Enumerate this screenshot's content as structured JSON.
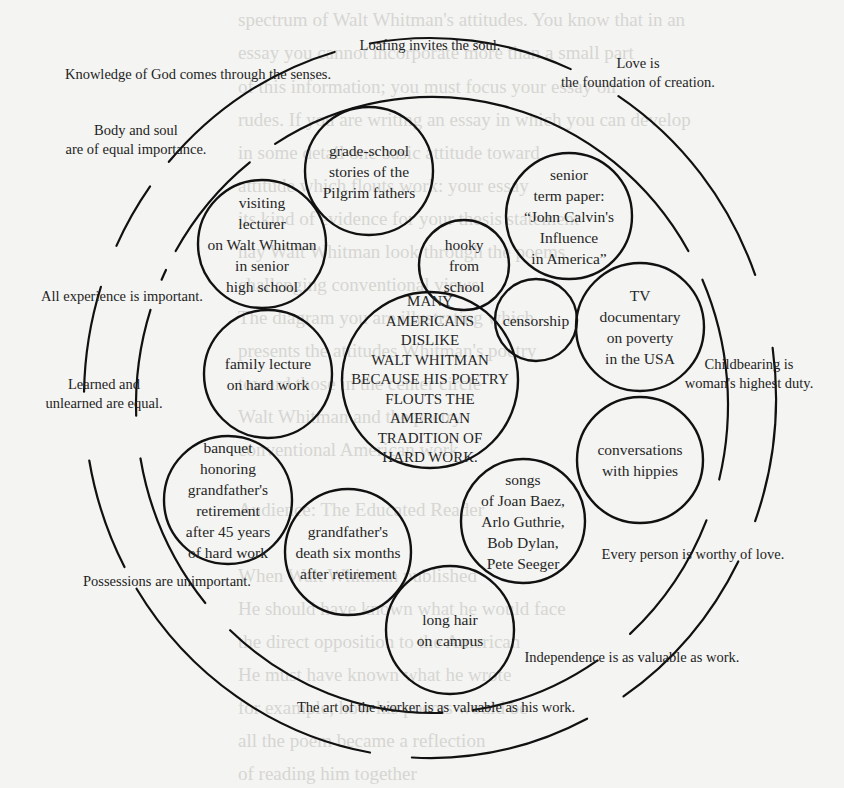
{
  "background_text": [
    {
      "text": "spectrum of Walt Whitman's attitudes. You know that in an",
      "x": 478,
      "y": 3
    },
    {
      "text": "essay you cannot incorporate more than a small part",
      "x": 478,
      "y": 36
    },
    {
      "text": "of this information; you must focus your essay on",
      "x": 478,
      "y": 70
    },
    {
      "text": "rudes. If you are writing an essay in which you can develop",
      "x": 478,
      "y": 103
    },
    {
      "text": "in some detail one basic attitude toward",
      "x": 478,
      "y": 136
    },
    {
      "text": "attitude which flouts work: your essay",
      "x": 478,
      "y": 169
    },
    {
      "text": "its kind of evidence for your thesis statement",
      "x": 478,
      "y": 202
    },
    {
      "text": "nay Walt Whitman look through the poems",
      "x": 478,
      "y": 235
    },
    {
      "text": "challenging conventional views",
      "x": 478,
      "y": 268
    },
    {
      "text": "The diagram you are illustrating which",
      "x": 478,
      "y": 301
    },
    {
      "text": "presents the attitudes Whitman's poetry",
      "x": 478,
      "y": 334
    },
    {
      "text": "toward those in the center circle",
      "x": 478,
      "y": 367
    },
    {
      "text": "Walt Whitman and the poetry",
      "x": 478,
      "y": 400
    },
    {
      "text": "conventional American work",
      "x": 478,
      "y": 433
    },
    {
      "text": "Audience: The Educated Reader",
      "x": 478,
      "y": 493
    },
    {
      "text": "When Walt Whitman published",
      "x": 478,
      "y": 559
    },
    {
      "text": "He should have known what he would face",
      "x": 478,
      "y": 592
    },
    {
      "text": "the direct opposition to the American",
      "x": 478,
      "y": 625
    },
    {
      "text": "He must have known what he wrote",
      "x": 478,
      "y": 658
    },
    {
      "text": "for example, how his poems would be",
      "x": 478,
      "y": 691
    },
    {
      "text": "all the poem became a reflection",
      "x": 478,
      "y": 724
    },
    {
      "text": "of reading him together",
      "x": 478,
      "y": 757
    }
  ],
  "diagram": {
    "stroke_color": "#111111",
    "outer_ring_labels": [
      {
        "id": "loafing",
        "lines": [
          "Loafing invites the soul."
        ],
        "x": 430,
        "y": 46
      },
      {
        "id": "love-creation",
        "lines": [
          "Love is",
          "the foundation of creation."
        ],
        "x": 638,
        "y": 64
      },
      {
        "id": "childbearing",
        "lines": [
          "Childbearing is",
          "woman's highest duty."
        ],
        "x": 749,
        "y": 365
      },
      {
        "id": "worthy-love",
        "lines": [
          "Every person is worthy of love."
        ],
        "x": 693,
        "y": 555
      },
      {
        "id": "art-worker",
        "lines": [
          "The art of the worker is as valuable as his work."
        ],
        "x": 436,
        "y": 708
      },
      {
        "id": "learned",
        "lines": [
          "Learned and",
          "unlearned are equal."
        ],
        "x": 104,
        "y": 385
      }
    ],
    "inner_ring_labels": [
      {
        "id": "knowledge-god",
        "lines": [
          "Knowledge of God comes through the senses."
        ],
        "x": 198,
        "y": 75
      },
      {
        "id": "body-soul",
        "lines": [
          "Body and soul",
          "are of equal importance."
        ],
        "x": 136,
        "y": 131
      },
      {
        "id": "all-experience",
        "lines": [
          "All experience is important."
        ],
        "x": 122,
        "y": 297
      },
      {
        "id": "possessions",
        "lines": [
          "Possessions are unimportant."
        ],
        "x": 167,
        "y": 582
      },
      {
        "id": "independence",
        "lines": [
          "Independence is as valuable as work."
        ],
        "x": 632,
        "y": 658
      }
    ],
    "core": {
      "id": "thesis",
      "lines": [
        "MANY",
        "AMERICANS",
        "DISLIKE",
        "WALT WHITMAN",
        "BECAUSE HIS POETRY",
        "FLOUTS THE",
        "AMERICAN",
        "TRADITION  OF",
        "HARD WORK."
      ],
      "cx": 430,
      "cy": 380,
      "r": 88
    },
    "experience_circles": [
      {
        "id": "grade-school",
        "lines": [
          "grade-school",
          "stories of the",
          "Pilgrim fathers"
        ],
        "cx": 369,
        "cy": 171,
        "r": 64
      },
      {
        "id": "visiting-lecturer",
        "lines": [
          "visiting",
          "lecturer",
          "on Walt Whitman",
          "in senior",
          "high school"
        ],
        "cx": 262,
        "cy": 244,
        "r": 64
      },
      {
        "id": "senior-term-paper",
        "lines": [
          "senior",
          "term paper:",
          "“John Calvin's",
          "Influence",
          "in America”"
        ],
        "cx": 569,
        "cy": 216,
        "r": 63
      },
      {
        "id": "hooky",
        "lines": [
          "hooky",
          "from",
          "school"
        ],
        "cx": 464,
        "cy": 265,
        "r": 45
      },
      {
        "id": "censorship",
        "lines": [
          "censorship"
        ],
        "cx": 536,
        "cy": 320,
        "r": 41
      },
      {
        "id": "tv-documentary",
        "lines": [
          "TV",
          "documentary",
          "on poverty",
          "in the USA"
        ],
        "cx": 640,
        "cy": 327,
        "r": 64
      },
      {
        "id": "family-lecture",
        "lines": [
          "family lecture",
          "on hard work"
        ],
        "cx": 268,
        "cy": 374,
        "r": 64
      },
      {
        "id": "conversations-hippies",
        "lines": [
          "conversations",
          "with hippies"
        ],
        "cx": 640,
        "cy": 460,
        "r": 63
      },
      {
        "id": "banquet",
        "lines": [
          "banquet",
          "honoring",
          "grandfather's",
          "retirement",
          "after 45 years",
          "of hard work"
        ],
        "cx": 228,
        "cy": 500,
        "r": 64
      },
      {
        "id": "songs",
        "lines": [
          "songs",
          "of Joan Baez,",
          "Arlo Guthrie,",
          "Bob Dylan,",
          "Pete Seeger"
        ],
        "cx": 523,
        "cy": 521,
        "r": 62
      },
      {
        "id": "grandfather-death",
        "lines": [
          "grandfather's",
          "death six months",
          "after retirement"
        ],
        "cx": 348,
        "cy": 552,
        "r": 63
      },
      {
        "id": "long-hair",
        "lines": [
          "long hair",
          "on campus"
        ],
        "cx": 450,
        "cy": 630,
        "r": 64
      }
    ]
  }
}
